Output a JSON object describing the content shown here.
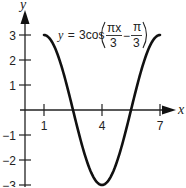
{
  "chart_data": {
    "type": "line",
    "title": "",
    "equation": {
      "lhs": "y",
      "equals": "=",
      "coef": "3cos",
      "frac1_num": "πx",
      "frac1_den": "3",
      "minus": "−",
      "frac2_num": "π",
      "frac2_den": "3"
    },
    "function": "y = 3cos(πx/3 − π/3)",
    "xlabel": "x",
    "ylabel": "y",
    "x_ticks": [
      {
        "value": 1,
        "label": "1"
      },
      {
        "value": 4,
        "label": "4"
      },
      {
        "value": 7,
        "label": "7"
      }
    ],
    "y_ticks": [
      {
        "value": 3,
        "label": "3"
      },
      {
        "value": 2,
        "label": "2"
      },
      {
        "value": 1,
        "label": "1"
      },
      {
        "value": -1,
        "label": "−1"
      },
      {
        "value": -2,
        "label": "−2"
      },
      {
        "value": -3,
        "label": "−3"
      }
    ],
    "xlim": [
      1,
      7
    ],
    "ylim": [
      -3,
      3
    ],
    "grid": false,
    "series": [
      {
        "name": "y = 3cos(πx/3 − π/3)",
        "x": [
          1,
          1.5,
          2,
          2.5,
          3,
          3.5,
          4,
          4.5,
          5,
          5.5,
          6,
          6.5,
          7
        ],
        "values": [
          3,
          2.6,
          1.5,
          0,
          -1.5,
          -2.6,
          -3,
          -2.6,
          -1.5,
          0,
          1.5,
          2.6,
          3
        ]
      }
    ],
    "key_points": {
      "maxima": [
        [
          1,
          3
        ],
        [
          7,
          3
        ]
      ],
      "minimum": [
        4,
        -3
      ],
      "zeros": [
        2.5,
        5.5
      ]
    }
  }
}
